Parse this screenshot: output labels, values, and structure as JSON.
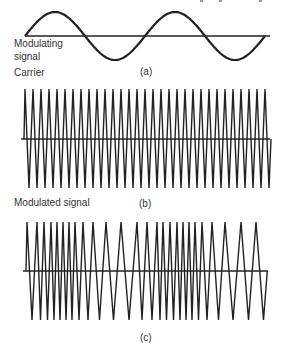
{
  "figure": {
    "panels": [
      {
        "id": "a",
        "caption": "(a)",
        "label_line1": "Modulating",
        "label_line2": "signal",
        "type": "sine"
      },
      {
        "id": "b",
        "caption": "(b)",
        "label": "Carrier",
        "type": "carrier"
      },
      {
        "id": "c",
        "caption": "(c)",
        "label": "Modulated signal",
        "type": "fm"
      }
    ],
    "colors": {
      "stroke": "#222222",
      "background": "#ffffff"
    },
    "modulating": {
      "x_start": 25,
      "x_end": 265,
      "baseline_y": 36,
      "amplitude": 24,
      "cycles": 2
    },
    "carrier": {
      "baseline_y": 139,
      "top_y": 89,
      "bottom_y": 188,
      "peaks_x": [
        25,
        33,
        41,
        49,
        57,
        65,
        73,
        81,
        89,
        97,
        105,
        113,
        121,
        129,
        137,
        145,
        153,
        161,
        169,
        177,
        185,
        193,
        201,
        209,
        217,
        225,
        233,
        241,
        249,
        257,
        265
      ]
    },
    "fm": {
      "baseline_y": 271,
      "top_y": 222,
      "bottom_y": 320,
      "peaks_x": [
        27,
        37,
        44,
        51,
        57,
        63,
        69,
        75,
        83,
        93,
        106,
        121,
        137,
        147,
        157,
        163,
        170,
        177,
        183,
        189,
        195,
        202,
        212,
        225,
        241,
        256
      ]
    }
  }
}
